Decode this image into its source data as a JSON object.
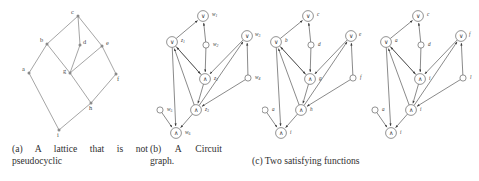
{
  "figure": {
    "panels": [
      {
        "id": "a",
        "caption": "(a) A lattice that is not pseudocyclic",
        "type": "lattice",
        "nodes": [
          {
            "label": "c",
            "x": 78,
            "y": 16,
            "lx": 71,
            "ly": 14
          },
          {
            "label": "b",
            "x": 47,
            "y": 44,
            "lx": 40,
            "ly": 42
          },
          {
            "label": "d",
            "x": 80,
            "y": 45,
            "lx": 83,
            "ly": 44
          },
          {
            "label": "e",
            "x": 102,
            "y": 46,
            "lx": 106,
            "ly": 45
          },
          {
            "label": "a",
            "x": 29,
            "y": 73,
            "lx": 22,
            "ly": 71
          },
          {
            "label": "g",
            "x": 70,
            "y": 73,
            "lx": 63,
            "ly": 73
          },
          {
            "label": "f",
            "x": 116,
            "y": 74,
            "lx": 117,
            "ly": 81
          },
          {
            "label": "h",
            "x": 91,
            "y": 103,
            "lx": 89,
            "ly": 110
          },
          {
            "label": "i",
            "x": 59,
            "y": 130,
            "lx": 57,
            "ly": 137
          }
        ],
        "edges": [
          [
            0,
            1
          ],
          [
            0,
            2
          ],
          [
            0,
            3
          ],
          [
            1,
            4
          ],
          [
            1,
            5
          ],
          [
            2,
            5
          ],
          [
            3,
            5
          ],
          [
            3,
            6
          ],
          [
            5,
            7
          ],
          [
            6,
            7
          ],
          [
            4,
            8
          ],
          [
            7,
            8
          ]
        ]
      },
      {
        "id": "b",
        "caption": "(b) A Circuit graph.",
        "type": "circuit",
        "nodes": [
          {
            "label": "w1",
            "kind": "or",
            "x": 55,
            "y": 16,
            "lx": 64,
            "ly": 14
          },
          {
            "label": "z1",
            "kind": "or",
            "x": 24,
            "y": 42,
            "lx": 33,
            "ly": 40
          },
          {
            "label": "w2",
            "kind": "var",
            "x": 58,
            "y": 45,
            "lx": 65,
            "ly": 44
          },
          {
            "label": "w3",
            "kind": "or",
            "x": 99,
            "y": 36,
            "lx": 107,
            "ly": 34
          },
          {
            "label": "z2",
            "kind": "and",
            "x": 57,
            "y": 79,
            "lx": 66,
            "ly": 78
          },
          {
            "label": "w4",
            "kind": "var",
            "x": 100,
            "y": 78,
            "lx": 107,
            "ly": 77
          },
          {
            "label": "w5",
            "kind": "var",
            "x": 12,
            "y": 110,
            "lx": 19,
            "ly": 109
          },
          {
            "label": "z3",
            "kind": "and",
            "x": 48,
            "y": 110,
            "lx": 57,
            "ly": 109
          },
          {
            "label": "w6",
            "kind": "and",
            "x": 28,
            "y": 133,
            "lx": 37,
            "ly": 132
          }
        ],
        "edges": [
          [
            1,
            0
          ],
          [
            2,
            0
          ],
          [
            2,
            4
          ],
          [
            4,
            1
          ],
          [
            5,
            3
          ],
          [
            5,
            7
          ],
          [
            7,
            1
          ],
          [
            7,
            3
          ],
          [
            4,
            7
          ],
          [
            6,
            8
          ],
          [
            7,
            8
          ],
          [
            1,
            8
          ],
          [
            1,
            4
          ],
          [
            3,
            4
          ]
        ]
      },
      {
        "id": "c",
        "caption": "(c) Two satisfying functions",
        "type": "twofunctions",
        "subgraphs": [
          {
            "offset": 0,
            "nodes": [
              {
                "label": "c",
                "kind": "or",
                "x": 46,
                "y": 16,
                "lx": 55,
                "ly": 14
              },
              {
                "label": "b",
                "kind": "or",
                "x": 14,
                "y": 42,
                "lx": 23,
                "ly": 40
              },
              {
                "label": "d",
                "kind": "var",
                "x": 49,
                "y": 45,
                "lx": 56,
                "ly": 44
              },
              {
                "label": "e",
                "kind": "or",
                "x": 89,
                "y": 36,
                "lx": 97,
                "ly": 34
              },
              {
                "label": "g",
                "kind": "and",
                "x": 48,
                "y": 79,
                "lx": 57,
                "ly": 78
              },
              {
                "label": "f",
                "kind": "var",
                "x": 91,
                "y": 78,
                "lx": 98,
                "ly": 77
              },
              {
                "label": "a",
                "kind": "var",
                "x": 3,
                "y": 110,
                "lx": 10,
                "ly": 109
              },
              {
                "label": "h",
                "kind": "and",
                "x": 39,
                "y": 110,
                "lx": 48,
                "ly": 109
              },
              {
                "label": "i",
                "kind": "and",
                "x": 19,
                "y": 133,
                "lx": 28,
                "ly": 132
              }
            ],
            "edges": [
              [
                1,
                0
              ],
              [
                2,
                0
              ],
              [
                2,
                4
              ],
              [
                4,
                1
              ],
              [
                5,
                3
              ],
              [
                5,
                7
              ],
              [
                7,
                1
              ],
              [
                7,
                3
              ],
              [
                4,
                7
              ],
              [
                6,
                8
              ],
              [
                7,
                8
              ],
              [
                1,
                8
              ],
              [
                1,
                4
              ],
              [
                3,
                4
              ]
            ]
          },
          {
            "offset": 110,
            "nodes": [
              {
                "label": "c",
                "kind": "or",
                "x": 46,
                "y": 16,
                "lx": 55,
                "ly": 14
              },
              {
                "label": "a",
                "kind": "or",
                "x": 14,
                "y": 42,
                "lx": 23,
                "ly": 40
              },
              {
                "label": "d",
                "kind": "var",
                "x": 49,
                "y": 45,
                "lx": 56,
                "ly": 44
              },
              {
                "label": "f",
                "kind": "or",
                "x": 89,
                "y": 36,
                "lx": 97,
                "ly": 34
              },
              {
                "label": "i",
                "kind": "and",
                "x": 48,
                "y": 79,
                "lx": 57,
                "ly": 78
              },
              {
                "label": "l",
                "kind": "var",
                "x": 91,
                "y": 78,
                "lx": 98,
                "ly": 77
              },
              {
                "label": "a",
                "kind": "var",
                "x": 3,
                "y": 110,
                "lx": 10,
                "ly": 109
              },
              {
                "label": "i",
                "kind": "and",
                "x": 39,
                "y": 110,
                "lx": 48,
                "ly": 109
              },
              {
                "label": "i",
                "kind": "and",
                "x": 19,
                "y": 133,
                "lx": 28,
                "ly": 132
              }
            ],
            "edges": [
              [
                1,
                0
              ],
              [
                2,
                0
              ],
              [
                2,
                4
              ],
              [
                4,
                1
              ],
              [
                5,
                3
              ],
              [
                5,
                7
              ],
              [
                7,
                1
              ],
              [
                7,
                3
              ],
              [
                4,
                7
              ],
              [
                6,
                8
              ],
              [
                7,
                8
              ],
              [
                1,
                8
              ],
              [
                1,
                4
              ],
              [
                3,
                4
              ]
            ]
          }
        ]
      }
    ],
    "symbols": {
      "or": "∨",
      "and": "∧"
    },
    "colors": {
      "edge": "#5a5a5a",
      "node_stroke": "#4a4a4a",
      "text": "#2f2f2f",
      "background": "#ffffff"
    }
  }
}
